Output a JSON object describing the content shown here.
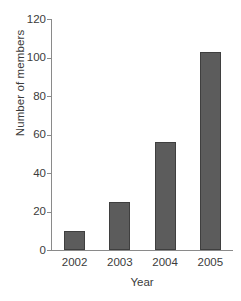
{
  "chart_data": {
    "type": "bar",
    "title": "",
    "xlabel": "Year",
    "ylabel": "Number of members",
    "categories": [
      "2002",
      "2003",
      "2004",
      "2005"
    ],
    "values": [
      10,
      25,
      56,
      103
    ],
    "ylim": [
      0,
      120
    ],
    "yticks": [
      0,
      20,
      40,
      60,
      80,
      100,
      120
    ],
    "ytick_labels": [
      "0",
      "20",
      "40",
      "60",
      "80",
      "100",
      "120"
    ],
    "grid": false,
    "legend": null,
    "series": [
      {
        "name": "Number of members",
        "values": [
          10,
          25,
          56,
          103
        ]
      }
    ]
  },
  "style": {
    "bar_fill": "#5c5c5c",
    "bar_border": "#3f3f3f",
    "axis_color": "#8a8a8a",
    "text_color": "#3b3b3b",
    "background": "#ffffff"
  }
}
